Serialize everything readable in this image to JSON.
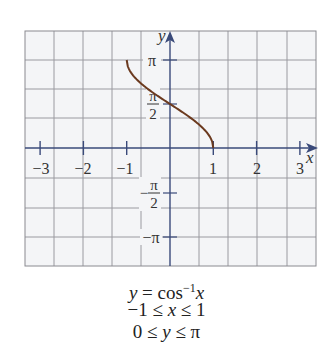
{
  "chart_data": {
    "type": "line",
    "title": "",
    "function": "y = cos^-1 x",
    "xlabel": "x",
    "ylabel": "y",
    "xlim": [
      -3.3,
      3.4
    ],
    "ylim": [
      -3.93,
      3.93
    ],
    "x_ticks": [
      -3,
      -2,
      -1,
      1,
      2,
      3
    ],
    "x_tick_labels": [
      "−3",
      "−2",
      "−1",
      "1",
      "2",
      "3"
    ],
    "y_ticks": [
      3.14159,
      1.5708,
      -1.5708,
      -3.14159
    ],
    "y_tick_labels": [
      "π",
      "π/2",
      "−π/2",
      "−π"
    ],
    "grid": true,
    "legend": null,
    "series": [
      {
        "name": "y = cos⁻¹x",
        "color": "#6b3a1f",
        "x": [
          -1,
          -0.9,
          -0.75,
          -0.5,
          -0.25,
          0,
          0.25,
          0.5,
          0.75,
          0.9,
          1
        ],
        "y": [
          3.1416,
          2.6906,
          2.4189,
          2.0944,
          1.8235,
          1.5708,
          1.3181,
          1.0472,
          0.7227,
          0.451,
          0
        ]
      }
    ],
    "annotations": [
      "y = cos⁻¹x",
      "−1 ≤ x ≤ 1",
      "0 ≤ y ≤ π"
    ]
  },
  "labels": {
    "x_axis": "x",
    "y_axis": "y",
    "pi": "π",
    "pi_num": "π",
    "two": "2",
    "neg": "−",
    "neg_pi": "−π",
    "x_ticks": [
      "−3",
      "−2",
      "−1",
      "1",
      "2",
      "3"
    ]
  },
  "caption": {
    "line1_y": "y",
    "line1_eq": " = cos",
    "line1_sup": "−1",
    "line1_x": "x",
    "line2_pre": "−1 ≤ ",
    "line2_x": "x",
    "line2_post": " ≤ 1",
    "line3_pre": "0 ≤ ",
    "line3_y": "y",
    "line3_post": " ≤ π"
  },
  "colors": {
    "grid": "#9a9aa0",
    "axis": "#3a4a7a",
    "curve": "#6b3a1f",
    "background": "#f3f4f6"
  }
}
